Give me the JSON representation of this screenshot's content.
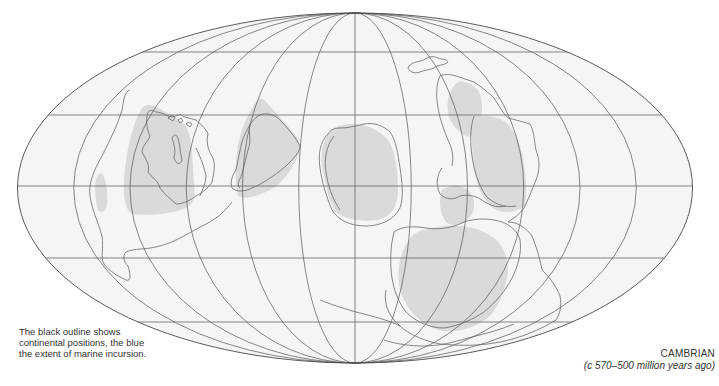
{
  "map": {
    "projection": "mollweide",
    "ellipse": {
      "cx": 355,
      "cy": 188,
      "rx": 337.5,
      "ry": 175
    },
    "parallels_y": [
      52,
      115,
      186,
      258,
      322
    ],
    "meridian_count": 13,
    "colors": {
      "ocean": "#f4f5f5",
      "grid": "#555555",
      "outline": "#6a6a6a",
      "marine_incursion": "#d9dadb",
      "background": "#ffffff"
    }
  },
  "captions": {
    "legend_note": "The black outline shows continental positions, the blue the extent of marine incursion.",
    "era_title": "CAMBRIAN",
    "era_range": "(c 570–500 million years ago)"
  }
}
